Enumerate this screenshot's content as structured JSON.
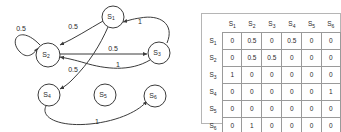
{
  "figure": {
    "graph": {
      "name": "markov-chain-state-diagram",
      "nodes": [
        {
          "id": "S1",
          "label": "S",
          "sub": "1",
          "cx": 113,
          "cy": 17,
          "r": 11
        },
        {
          "id": "S2",
          "label": "S",
          "sub": "2",
          "cx": 48,
          "cy": 55,
          "r": 12
        },
        {
          "id": "S3",
          "label": "S",
          "sub": "3",
          "cx": 159,
          "cy": 53,
          "r": 11
        },
        {
          "id": "S4",
          "label": "S",
          "sub": "4",
          "cx": 49,
          "cy": 95,
          "r": 11
        },
        {
          "id": "S5",
          "label": "S",
          "sub": "5",
          "cx": 105,
          "cy": 95,
          "r": 11
        },
        {
          "id": "S6",
          "label": "S",
          "sub": "6",
          "cx": 155,
          "cy": 96,
          "r": 11
        }
      ],
      "edges": [
        {
          "from": "S2",
          "to": "S2",
          "label": "0.5",
          "label_x": 21,
          "label_y": 29
        },
        {
          "from": "S1",
          "to": "S2",
          "label": "0.5",
          "label_x": 73,
          "label_y": 27
        },
        {
          "from": "S2",
          "to": "S3",
          "label": "0.5",
          "label_x": 113,
          "label_y": 49
        },
        {
          "from": "S3",
          "to": "S1",
          "label": "1",
          "label_x": 140,
          "label_y": 22
        },
        {
          "from": "S1",
          "to": "S4",
          "label": "0.5",
          "label_x": 73,
          "label_y": 70
        },
        {
          "from": "S3",
          "to": "S2",
          "label": "1",
          "label_x": 118,
          "label_y": 65
        },
        {
          "from": "S4",
          "to": "S6",
          "label": "1",
          "label_x": 97,
          "label_y": 122
        }
      ]
    },
    "matrix": {
      "name": "transition-probability-matrix",
      "col_headers": [
        "S1",
        "S2",
        "S3",
        "S4",
        "S5",
        "S6"
      ],
      "row_headers": [
        "S1",
        "S2",
        "S3",
        "S4",
        "S5",
        "S6"
      ],
      "rows": [
        [
          "0",
          "0.5",
          "0",
          "0.5",
          "0",
          "0"
        ],
        [
          "0",
          "0.5",
          "0.5",
          "0",
          "0",
          "0"
        ],
        [
          "1",
          "0",
          "0",
          "0",
          "0",
          "0"
        ],
        [
          "0",
          "0",
          "0",
          "0",
          "0",
          "1"
        ],
        [
          "0",
          "0",
          "0",
          "0",
          "0",
          "0"
        ],
        [
          "0",
          "1",
          "0",
          "0",
          "0",
          "0"
        ]
      ]
    }
  },
  "colors": {
    "stroke": "#3b3b3b",
    "text": "#2a2a2a",
    "grid": "#9a9a9a",
    "background": "#ffffff"
  }
}
